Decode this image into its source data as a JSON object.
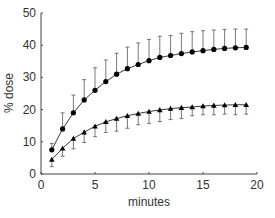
{
  "chart_data": {
    "type": "line",
    "title": "",
    "xlabel": "minutes",
    "ylabel": "% dose",
    "xlim": [
      0,
      20
    ],
    "ylim": [
      0,
      50
    ],
    "xticks": [
      0,
      5,
      10,
      15,
      20
    ],
    "yticks": [
      0,
      10,
      20,
      30,
      40,
      50
    ],
    "grid": false,
    "legend": "none",
    "x": [
      1,
      2,
      3,
      4,
      5,
      6,
      7,
      8,
      9,
      10,
      11,
      12,
      13,
      14,
      15,
      16,
      17,
      18,
      19
    ],
    "series": [
      {
        "name": "circles",
        "marker": "circle",
        "values": [
          7.5,
          14,
          19,
          23,
          26,
          28.7,
          31,
          32.7,
          34,
          35.2,
          36.2,
          36.8,
          37.4,
          37.9,
          38.3,
          38.7,
          39,
          39.2,
          39.3
        ],
        "error_upper": [
          9.5,
          19,
          24.5,
          29.3,
          33,
          35.4,
          37.5,
          39.4,
          40.7,
          41.8,
          42.8,
          43,
          43.7,
          44.2,
          44.5,
          44.7,
          44.9,
          45,
          45
        ],
        "error_direction": "up"
      },
      {
        "name": "triangles",
        "marker": "triangle",
        "values": [
          4.5,
          8,
          11,
          13,
          14.8,
          16.2,
          17.2,
          18.1,
          18.8,
          19.4,
          19.9,
          20.3,
          20.6,
          20.8,
          21.1,
          21.3,
          21.4,
          21.5,
          21.5
        ],
        "error_lower": [
          2.3,
          5.5,
          7.8,
          9.8,
          11.6,
          12.9,
          13.3,
          14.2,
          15.3,
          15.7,
          16.3,
          16.9,
          17.2,
          18.1,
          18.4,
          18.4,
          18.6,
          18.4,
          18.6
        ],
        "error_direction": "down"
      }
    ]
  }
}
